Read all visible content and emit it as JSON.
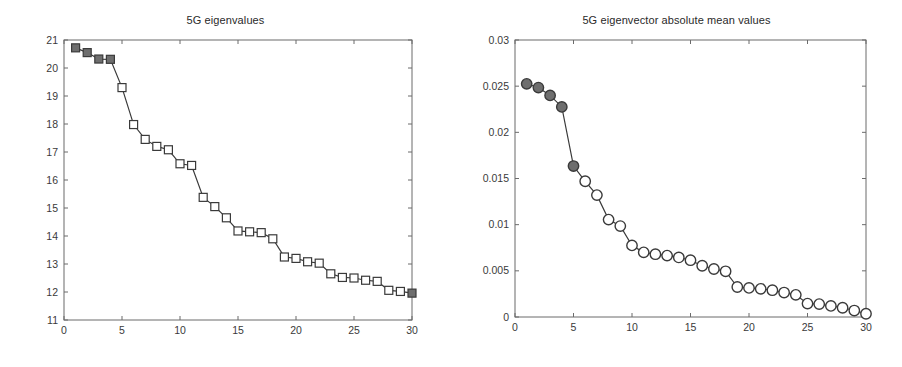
{
  "figure": {
    "width": 902,
    "height": 367,
    "background": "#ffffff",
    "line_color": "#3a3a3a",
    "marker_edge_color": "#3a3a3a",
    "marker_fill_color": "#6e6e6e",
    "axis_color": "#6b6b6b"
  },
  "charts": [
    {
      "id": "eigenvalues",
      "title": "5G eigenvalues",
      "type": "line",
      "marker": "square",
      "xlabel": "",
      "ylabel": "",
      "xlim": [
        0,
        30
      ],
      "ylim": [
        11,
        21
      ],
      "xticks": [
        0,
        5,
        10,
        15,
        20,
        25,
        30
      ],
      "yticks": [
        11,
        12,
        13,
        14,
        15,
        16,
        17,
        18,
        19,
        20,
        21
      ],
      "xtick_labels": [
        "0",
        "5",
        "10",
        "15",
        "20",
        "25",
        "30"
      ],
      "ytick_labels": [
        "11",
        "12",
        "13",
        "14",
        "15",
        "16",
        "17",
        "18",
        "19",
        "20",
        "21"
      ],
      "grid": false,
      "legend": null,
      "filled_indices": [
        1,
        2,
        3,
        4,
        30
      ],
      "x": [
        1,
        2,
        3,
        4,
        5,
        6,
        7,
        8,
        9,
        10,
        11,
        12,
        13,
        14,
        15,
        16,
        17,
        18,
        19,
        20,
        21,
        22,
        23,
        24,
        25,
        26,
        27,
        28,
        29,
        30
      ],
      "y": [
        20.72,
        20.55,
        20.32,
        20.31,
        19.3,
        17.98,
        17.45,
        17.2,
        17.08,
        16.58,
        16.52,
        15.38,
        15.05,
        14.65,
        14.18,
        14.15,
        14.12,
        13.9,
        13.25,
        13.2,
        13.08,
        13.03,
        12.65,
        12.52,
        12.5,
        12.42,
        12.38,
        12.06,
        12.02,
        11.96
      ]
    },
    {
      "id": "eigenvector-abs-mean",
      "title": "5G eigenvector absolute mean values",
      "type": "line",
      "marker": "circle",
      "xlabel": "",
      "ylabel": "",
      "xlim": [
        0,
        30
      ],
      "ylim": [
        0,
        0.03
      ],
      "xticks": [
        0,
        5,
        10,
        15,
        20,
        25,
        30
      ],
      "yticks": [
        0,
        0.005,
        0.01,
        0.015,
        0.02,
        0.025,
        0.03
      ],
      "xtick_labels": [
        "0",
        "5",
        "10",
        "15",
        "20",
        "25",
        "30"
      ],
      "ytick_labels": [
        "0",
        "0.005",
        "0.01",
        "0.015",
        "0.02",
        "0.025",
        "0.03"
      ],
      "grid": false,
      "legend": null,
      "filled_indices": [
        1,
        2,
        3,
        4,
        5
      ],
      "x": [
        1,
        2,
        3,
        4,
        5,
        6,
        7,
        8,
        9,
        10,
        11,
        12,
        13,
        14,
        15,
        16,
        17,
        18,
        19,
        20,
        21,
        22,
        23,
        24,
        25,
        26,
        27,
        28,
        29,
        30
      ],
      "y": [
        0.02525,
        0.02485,
        0.024,
        0.02275,
        0.01635,
        0.0147,
        0.0132,
        0.01055,
        0.00985,
        0.00775,
        0.007,
        0.0068,
        0.00665,
        0.00645,
        0.00615,
        0.00555,
        0.0052,
        0.00495,
        0.00325,
        0.00315,
        0.00305,
        0.0029,
        0.00265,
        0.0024,
        0.00145,
        0.0014,
        0.0012,
        0.001,
        0.0007,
        0.00035
      ]
    }
  ]
}
